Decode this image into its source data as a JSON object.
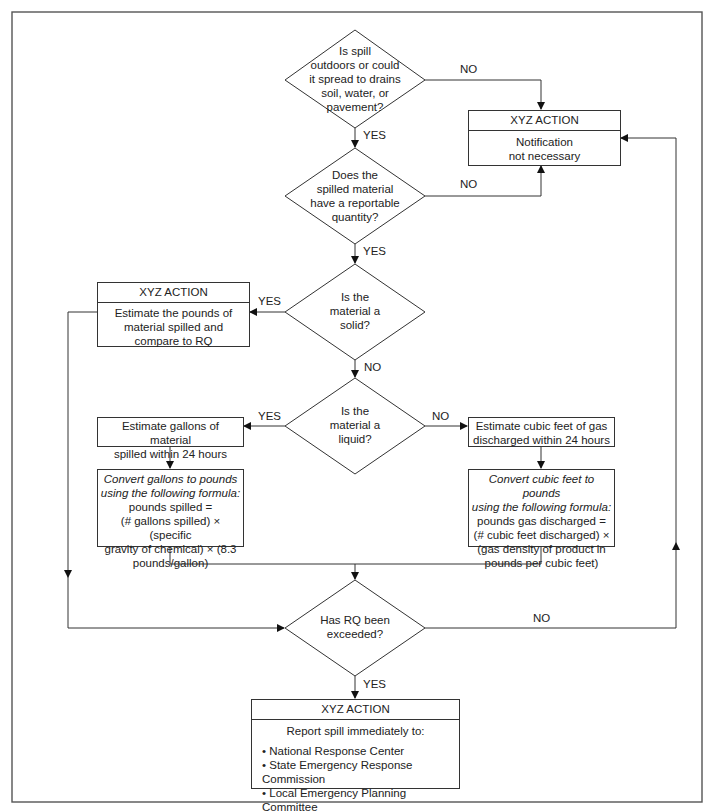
{
  "diagram": {
    "type": "flowchart",
    "decisions": [
      {
        "id": "d1",
        "text": "Is spill outdoors or could it spread to drains soil, water, or pavement?",
        "lines": [
          "Is spill",
          "outdoors or could",
          "it spread to drains",
          "soil, water, or",
          "pavement?"
        ],
        "yes_label": "YES",
        "no_label": "NO"
      },
      {
        "id": "d2",
        "text": "Does the spilled material have a reportable quantity?",
        "lines": [
          "Does the",
          "spilled material",
          "have a reportable",
          "quantity?"
        ],
        "yes_label": "YES",
        "no_label": "NO"
      },
      {
        "id": "d3",
        "text": "Is the material a solid?",
        "lines": [
          "Is the",
          "material a",
          "solid?"
        ],
        "yes_label": "YES",
        "no_label": "NO"
      },
      {
        "id": "d4",
        "text": "Is the material a liquid?",
        "lines": [
          "Is the",
          "material a",
          "liquid?"
        ],
        "yes_label": "YES",
        "no_label": "NO"
      },
      {
        "id": "d5",
        "text": "Has RQ been exceeded?",
        "lines": [
          "Has RQ been",
          "exceeded?"
        ],
        "yes_label": "YES",
        "no_label": "NO"
      }
    ],
    "actions": {
      "notification": {
        "header": "XYZ ACTION",
        "lines": [
          "Notification",
          "not necessary"
        ]
      },
      "solid": {
        "header": "XYZ ACTION",
        "lines": [
          "Estimate the pounds of",
          "material spilled and",
          "compare to RQ"
        ]
      },
      "liquid_estimate": {
        "lines": [
          "Estimate gallons of material",
          "spilled within 24 hours"
        ]
      },
      "liquid_convert": {
        "italic_lines": [
          "Convert gallons to pounds",
          "using the following formula:"
        ],
        "lines": [
          "pounds spilled =",
          "(# gallons spilled) × (specific",
          "gravity of chemical) × (8.3",
          "pounds/gallon)"
        ]
      },
      "gas_estimate": {
        "lines": [
          "Estimate cubic feet of gas",
          "discharged within 24 hours"
        ]
      },
      "gas_convert": {
        "italic_lines": [
          "Convert cubic feet to pounds",
          "using the following formula:"
        ],
        "lines": [
          "pounds gas discharged =",
          "(# cubic feet discharged) ×",
          "(gas density of product in",
          "pounds per cubic feet)"
        ]
      },
      "report": {
        "header": "XYZ ACTION",
        "intro": "Report spill immediately to:",
        "items": [
          "National Response Center",
          "State Emergency Response Commission",
          "Local Emergency Planning Committee"
        ]
      }
    },
    "edges": [
      {
        "from": "d1",
        "to": "d2",
        "label": "YES"
      },
      {
        "from": "d1",
        "to": "notification",
        "label": "NO"
      },
      {
        "from": "d2",
        "to": "d3",
        "label": "YES"
      },
      {
        "from": "d2",
        "to": "notification",
        "label": "NO"
      },
      {
        "from": "d3",
        "to": "solid",
        "label": "YES"
      },
      {
        "from": "d3",
        "to": "d4",
        "label": "NO"
      },
      {
        "from": "d4",
        "to": "liquid_estimate",
        "label": "YES"
      },
      {
        "from": "d4",
        "to": "gas_estimate",
        "label": "NO"
      },
      {
        "from": "liquid_estimate",
        "to": "liquid_convert",
        "label": ""
      },
      {
        "from": "gas_estimate",
        "to": "gas_convert",
        "label": ""
      },
      {
        "from": "liquid_convert",
        "to": "d5",
        "label": ""
      },
      {
        "from": "gas_convert",
        "to": "d5",
        "label": ""
      },
      {
        "from": "solid",
        "to": "d5",
        "label": ""
      },
      {
        "from": "d5",
        "to": "report",
        "label": "YES"
      },
      {
        "from": "d5",
        "to": "notification",
        "label": "NO"
      }
    ]
  }
}
